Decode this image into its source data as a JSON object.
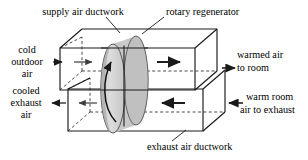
{
  "diagram": {
    "type": "isometric-schematic",
    "colors": {
      "line": "#1a1a1a",
      "hidden_line": "#2b2b2b",
      "wheel_face_light": "#d2d2d2",
      "wheel_face_mid": "#c2c2c2",
      "wheel_rim": "#b4b4b4",
      "wheel_shadow": "#a9a9a9",
      "background": "#ffffff"
    },
    "labels": {
      "supply_duct": "supply air ductwork",
      "regenerator": "rotary regenerator",
      "inlet_line1": "cold",
      "inlet_line2": "outdoor",
      "inlet_line3": "air",
      "outlet_line1": "warmed air",
      "outlet_line2": "to room",
      "exhaust_out_line1": "cooled",
      "exhaust_out_line2": "exhaust",
      "exhaust_out_line3": "air",
      "exhaust_in_line1": "warm room",
      "exhaust_in_line2": "air to exhaust",
      "exhaust_duct": "exhaust air ductwork"
    },
    "flow": {
      "supply_direction": "left-to-right",
      "exhaust_direction": "right-to-left",
      "wheel_rotation": "counter-clockwise"
    }
  }
}
